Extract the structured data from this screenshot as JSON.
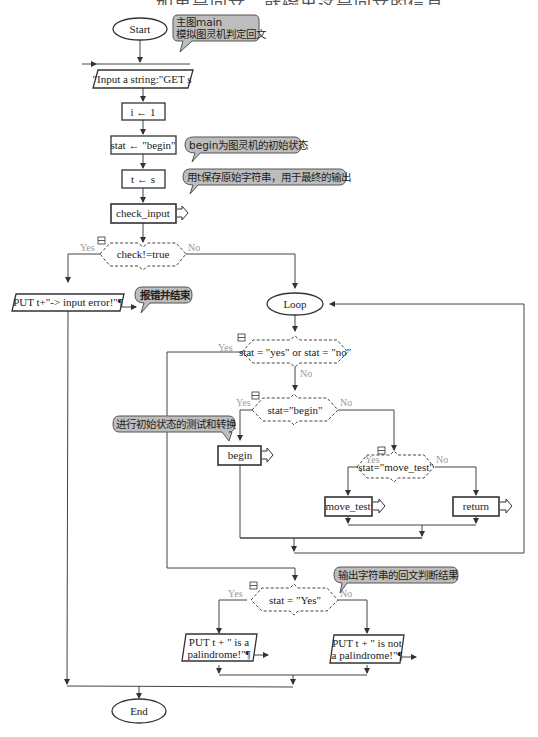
{
  "caption_clipped": "……如果是回文，就输出这是回文的信息。",
  "nodes": {
    "start": "Start",
    "input": "\"Input a string:\"GET s",
    "assign_i": "i ← 1",
    "assign_stat": "stat ← \"begin\"",
    "assign_t": "t ← s",
    "check_input": "check_input",
    "decision_check": "check!=true",
    "put_error": "PUT  t+\"-> input error!\"¶",
    "loop": "Loop",
    "decision_stat_yes_no": "stat = \"yes\" or stat = \"no\"",
    "decision_begin": "stat=\"begin\"",
    "begin_call": "begin",
    "decision_move_test": "stat=\"move_test\"",
    "move_test_call": "move_test",
    "return_call": "return",
    "decision_final": "stat = \"Yes\"",
    "put_yes_line1": "PUT t  +  \" is a",
    "put_yes_line2": "palindrome!\"¶",
    "put_no_line1": "PUT t  +  \" is not",
    "put_no_line2": "a palindrome!\"¶",
    "end": "End"
  },
  "branch_labels": {
    "yes": "Yes",
    "no": "No"
  },
  "comments": {
    "main_line1": "主图main",
    "main_line2": "模拟图灵机判定回文",
    "begin_state": "begin为图灵机的初始状态",
    "save_t": "用t保存原始字符串，用于最终的输出",
    "error_end": "报错并结束",
    "begin_test": "进行初始状态的测试和转换",
    "output_result": "输出字符串的回文判断结果"
  },
  "colors": {
    "stroke": "#333333",
    "comment_fill": "#bdbdbd",
    "branch_label": "#999999"
  }
}
